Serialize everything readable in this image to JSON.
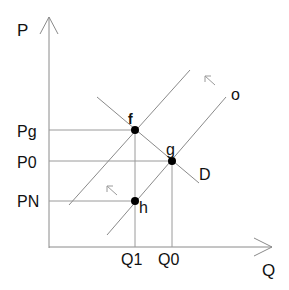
{
  "diagram": {
    "type": "supply-demand",
    "axes": {
      "y_label": "P",
      "x_label": "Q"
    },
    "price_labels": {
      "pg": "Pg",
      "p0": "P0",
      "pn": "PN"
    },
    "quantity_labels": {
      "q1": "Q1",
      "q0": "Q0"
    },
    "curves": {
      "supply_label": "o",
      "demand_label": "D"
    },
    "points": {
      "f": "f",
      "g": "g",
      "h": "h"
    },
    "shift_arrows": [
      "upper-left",
      "upper-left"
    ],
    "colors": {
      "line": "#8a8a8a",
      "point": "#000000",
      "text": "#111111"
    }
  }
}
